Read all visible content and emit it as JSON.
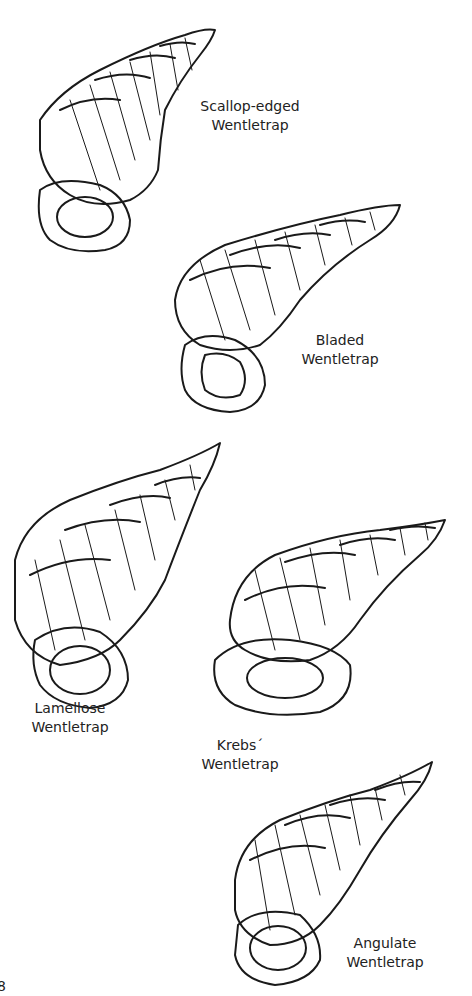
{
  "page": {
    "background": "#ffffff",
    "ink_color": "#1a1a1a",
    "page_number": "8"
  },
  "shells": [
    {
      "name": "Scallop-edged Wentletrap",
      "label_line1": "Scallop-edged",
      "label_line2": "Wentletrap"
    },
    {
      "name": "Bladed Wentletrap",
      "label_line1": "Bladed",
      "label_line2": "Wentletrap"
    },
    {
      "name": "Lamellose Wentletrap",
      "label_line1": "Lamellose",
      "label_line2": "Wentletrap"
    },
    {
      "name": "Krebs' Wentletrap",
      "label_line1": "Krebs´",
      "label_line2": "Wentletrap"
    },
    {
      "name": "Angulate Wentletrap",
      "label_line1": "Angulate",
      "label_line2": "Wentletrap"
    }
  ]
}
